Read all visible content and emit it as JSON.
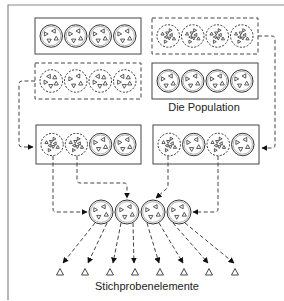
{
  "labels": {
    "population": "Die Population",
    "sample_elements": "Stichprobenelemente"
  },
  "colors": {
    "line": "#555555",
    "frame": "#888888",
    "background": "#ffffff"
  },
  "population_boxes": [
    {
      "id": "box-1",
      "border": "solid",
      "x": 35,
      "y": 18,
      "w": 106,
      "h": 36,
      "clusters": [
        {
          "style": "solid",
          "tri": 4
        },
        {
          "style": "solid",
          "tri": 4
        },
        {
          "style": "solid",
          "tri": 4
        },
        {
          "style": "solid",
          "tri": 4
        }
      ]
    },
    {
      "id": "box-2",
      "border": "dashed",
      "x": 152,
      "y": 18,
      "w": 106,
      "h": 36,
      "clusters": [
        {
          "style": "dashed",
          "tri": 8
        },
        {
          "style": "dashed",
          "tri": 8
        },
        {
          "style": "dashed",
          "tri": 8
        },
        {
          "style": "dashed",
          "tri": 8
        }
      ]
    },
    {
      "id": "box-3",
      "border": "dashed",
      "x": 35,
      "y": 63,
      "w": 106,
      "h": 36,
      "clusters": [
        {
          "style": "dashed",
          "tri": 5
        },
        {
          "style": "dashed",
          "tri": 4
        },
        {
          "style": "dashed",
          "tri": 5
        },
        {
          "style": "dashed",
          "tri": 5
        }
      ]
    },
    {
      "id": "box-4",
      "border": "solid",
      "x": 152,
      "y": 63,
      "w": 106,
      "h": 36,
      "clusters": [
        {
          "style": "solid",
          "tri": 4
        },
        {
          "style": "solid",
          "tri": 4
        },
        {
          "style": "solid",
          "tri": 4
        },
        {
          "style": "solid",
          "tri": 4
        }
      ]
    }
  ],
  "selected_boxes": [
    {
      "id": "sel-left",
      "x": 36,
      "y": 125,
      "w": 105,
      "h": 39,
      "clusters": [
        {
          "style": "dashed",
          "tri": 8
        },
        {
          "style": "dashed",
          "tri": 8
        },
        {
          "style": "solid",
          "tri": 4
        },
        {
          "style": "solid",
          "tri": 4
        }
      ]
    },
    {
      "id": "sel-right",
      "x": 153,
      "y": 125,
      "w": 106,
      "h": 39,
      "clusters": [
        {
          "style": "dashed",
          "tri": 8
        },
        {
          "style": "solid",
          "tri": 4
        },
        {
          "style": "dashed",
          "tri": 8
        },
        {
          "style": "solid",
          "tri": 4
        }
      ]
    }
  ],
  "sample_clusters": [
    {
      "cx": 101,
      "cy": 212,
      "tri": 4
    },
    {
      "cx": 127,
      "cy": 212,
      "tri": 4
    },
    {
      "cx": 153,
      "cy": 212,
      "tri": 4
    },
    {
      "cx": 179,
      "cy": 212,
      "tri": 4
    }
  ],
  "sample_elements": {
    "y": 272,
    "x": [
      60,
      85,
      110,
      135,
      160,
      184,
      209,
      235
    ],
    "glyph": "triangle"
  }
}
